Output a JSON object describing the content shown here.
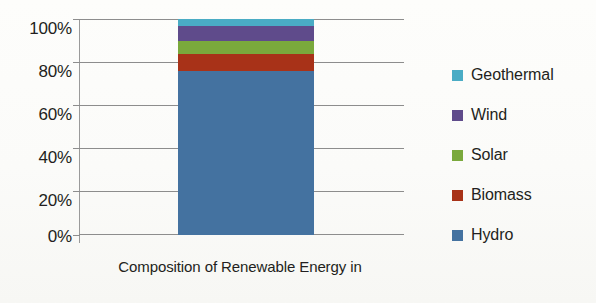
{
  "chart_data": {
    "type": "bar",
    "title": "",
    "xlabel": "Composition of Renewable Energy in",
    "ylabel": "",
    "categories": [
      "Composition of Renewable Energy in"
    ],
    "stacked": true,
    "grid": true,
    "legend_position": "right",
    "ylim": [
      0,
      100
    ],
    "yticks": [
      "0%",
      "20%",
      "40%",
      "60%",
      "80%",
      "100%"
    ],
    "ytick_values": [
      0,
      20,
      40,
      60,
      80,
      100
    ],
    "series": [
      {
        "name": "Hydro",
        "values": [
          76
        ],
        "color": "#4472a0"
      },
      {
        "name": "Biomass",
        "values": [
          8
        ],
        "color": "#a83218"
      },
      {
        "name": "Solar",
        "values": [
          6
        ],
        "color": "#7aa93c"
      },
      {
        "name": "Wind",
        "values": [
          7
        ],
        "color": "#5f4b8b"
      },
      {
        "name": "Geothermal",
        "values": [
          3
        ],
        "color": "#4aacc5"
      }
    ]
  },
  "axis": {
    "y_tick_labels": [
      "100%",
      "80%",
      "60%",
      "40%",
      "20%",
      "0%"
    ],
    "x_title": "Composition of Renewable Energy in"
  },
  "legend": {
    "items": [
      {
        "label": "Geothermal",
        "color": "#4aacc5"
      },
      {
        "label": "Wind",
        "color": "#5f4b8b"
      },
      {
        "label": "Solar",
        "color": "#7aa93c"
      },
      {
        "label": "Biomass",
        "color": "#a83218"
      },
      {
        "label": "Hydro",
        "color": "#4472a0"
      }
    ]
  },
  "colors": {
    "gridline": "#8d8d8d",
    "axis": "#9a9a9a",
    "text": "#231f20",
    "background": "#fdfdfb"
  }
}
